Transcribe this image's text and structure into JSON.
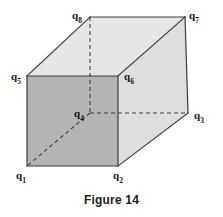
{
  "figure": {
    "caption": "Figure 14",
    "caption_position": {
      "x": 0,
      "y": 193
    },
    "canvas": {
      "width": 223,
      "height": 217,
      "background": "#ffffff"
    },
    "shape": "cube",
    "projection": "oblique parallel projection",
    "colors": {
      "front_face_fill": "#b4b4b4",
      "top_face_fill": "#e6e6e6",
      "right_face_fill": "#dedede",
      "edge_stroke": "#3c3c3c",
      "hidden_edge_stroke": "#3c3c3c",
      "label_color": "#111111",
      "caption_color": "#1a1a1a"
    },
    "vertices": [
      {
        "id": "q1",
        "letter": "q",
        "subscript": "1",
        "x": 27,
        "y": 166,
        "hidden": false,
        "label_x": 16,
        "label_y": 170
      },
      {
        "id": "q2",
        "letter": "q",
        "subscript": "2",
        "x": 118,
        "y": 166,
        "hidden": false,
        "label_x": 113,
        "label_y": 170
      },
      {
        "id": "q3",
        "letter": "q",
        "subscript": "3",
        "x": 188,
        "y": 113,
        "hidden": false,
        "label_x": 194,
        "label_y": 110
      },
      {
        "id": "q4",
        "letter": "q",
        "subscript": "4",
        "x": 90,
        "y": 113,
        "hidden": true,
        "label_x": 74,
        "label_y": 108
      },
      {
        "id": "q5",
        "letter": "q",
        "subscript": "5",
        "x": 27,
        "y": 76,
        "hidden": false,
        "label_x": 11,
        "label_y": 71
      },
      {
        "id": "q6",
        "letter": "q",
        "subscript": "6",
        "x": 118,
        "y": 76,
        "hidden": false,
        "label_x": 124,
        "label_y": 71
      },
      {
        "id": "q7",
        "letter": "q",
        "subscript": "7",
        "x": 185,
        "y": 17,
        "hidden": false,
        "label_x": 189,
        "label_y": 10
      },
      {
        "id": "q8",
        "letter": "q",
        "subscript": "8",
        "x": 90,
        "y": 17,
        "hidden": false,
        "label_x": 72,
        "label_y": 10
      }
    ],
    "faces": [
      {
        "id": "top-face",
        "name": "top-face",
        "points": "27,76 118,76 185,17 90,17",
        "fill": "#e6e6e6"
      },
      {
        "id": "right-face",
        "name": "right-face",
        "points": "118,76 185,17 188,113 118,166",
        "fill": "#dedede"
      },
      {
        "id": "front-face",
        "name": "front-face",
        "points": "27,76 118,76 118,166 27,166",
        "fill": "#b4b4b4"
      }
    ],
    "solid_edges": [
      {
        "name": "edge-q1-q2",
        "x1": 27,
        "y1": 166,
        "x2": 118,
        "y2": 166
      },
      {
        "name": "edge-q2-q6",
        "x1": 118,
        "y1": 166,
        "x2": 118,
        "y2": 76
      },
      {
        "name": "edge-q6-q5",
        "x1": 118,
        "y1": 76,
        "x2": 27,
        "y2": 76
      },
      {
        "name": "edge-q5-q1",
        "x1": 27,
        "y1": 76,
        "x2": 27,
        "y2": 166
      },
      {
        "name": "edge-q5-q8",
        "x1": 27,
        "y1": 76,
        "x2": 90,
        "y2": 17
      },
      {
        "name": "edge-q8-q7",
        "x1": 90,
        "y1": 17,
        "x2": 185,
        "y2": 17
      },
      {
        "name": "edge-q6-q7",
        "x1": 118,
        "y1": 76,
        "x2": 185,
        "y2": 17
      },
      {
        "name": "edge-q7-q3",
        "x1": 185,
        "y1": 17,
        "x2": 188,
        "y2": 113
      },
      {
        "name": "edge-q3-q2",
        "x1": 188,
        "y1": 113,
        "x2": 118,
        "y2": 166
      }
    ],
    "hidden_edges": [
      {
        "name": "hidden-edge-q8-q4",
        "x1": 90,
        "y1": 17,
        "x2": 90,
        "y2": 113
      },
      {
        "name": "hidden-edge-q4-q3",
        "x1": 90,
        "y1": 113,
        "x2": 188,
        "y2": 113
      },
      {
        "name": "hidden-diagonal-q4-q1",
        "x1": 90,
        "y1": 113,
        "x2": 27,
        "y2": 166
      }
    ]
  }
}
